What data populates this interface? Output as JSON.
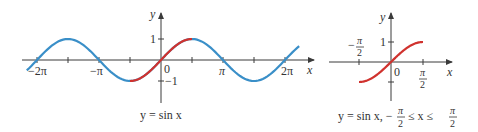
{
  "colors": {
    "axis": "#3a3a3a",
    "blue_curve": "#3a8fc8",
    "red_curve": "#d0322e",
    "text": "#333333"
  },
  "left_graph": {
    "x_axis_label": "x",
    "y_axis_label": "y",
    "x_tick_labels": [
      "−2π",
      "−π",
      "0",
      "π",
      "2π"
    ],
    "y_tick_labels": [
      "1",
      "−1"
    ],
    "caption": "y = sin x"
  },
  "right_graph": {
    "x_axis_label": "x",
    "y_axis_label": "y",
    "origin_label": "0",
    "y_tick_label": "1",
    "neg_half_pi": {
      "sign": "−",
      "num": "π",
      "den": "2"
    },
    "half_pi": {
      "num": "π",
      "den": "2"
    },
    "caption": {
      "main": "y = sin x, −",
      "num1": "π",
      "den1": "2",
      "mid": " ≤ x ≤ ",
      "num2": "π",
      "den2": "2"
    }
  },
  "chart_data": [
    {
      "type": "line",
      "title": "y = sin x",
      "xlabel": "x",
      "ylabel": "y",
      "xlim": [
        -6.9,
        7.0
      ],
      "ylim": [
        -1,
        1
      ],
      "x_ticks": [
        "−2π",
        "−3π/2",
        "−π",
        "−π/2",
        "0",
        "π/2",
        "π",
        "3π/2",
        "2π"
      ],
      "x_tick_labels": [
        "−2π",
        "−π",
        "0",
        "π",
        "2π"
      ],
      "y_tick_labels": [
        "1",
        "−1"
      ],
      "series": [
        {
          "name": "sin x (full)",
          "color": "#3a8fc8",
          "function": "sin(x)",
          "domain": [
            -6.8,
            7.0
          ]
        },
        {
          "name": "sin x restricted",
          "color": "#d0322e",
          "function": "sin(x)",
          "domain": [
            -1.5708,
            1.5708
          ]
        }
      ],
      "grid": false
    },
    {
      "type": "line",
      "title": "y = sin x, −π/2 ≤ x ≤ π/2",
      "xlabel": "x",
      "ylabel": "y",
      "xlim": [
        -1.5708,
        1.5708
      ],
      "ylim": [
        -1,
        1
      ],
      "x_tick_labels": [
        "−π/2",
        "0",
        "π/2"
      ],
      "y_tick_labels": [
        "1"
      ],
      "series": [
        {
          "name": "sin x restricted",
          "color": "#d0322e",
          "function": "sin(x)",
          "domain": [
            -1.5708,
            1.5708
          ]
        }
      ],
      "grid": false
    }
  ]
}
